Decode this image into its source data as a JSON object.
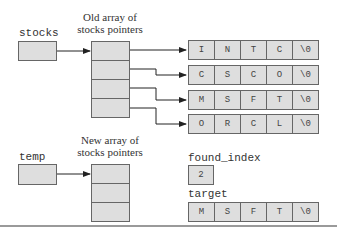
{
  "labels": {
    "stocks": "stocks",
    "temp": "temp",
    "old_array_caption_line1": "Old array of",
    "old_array_caption_line2": "stocks pointers",
    "new_array_caption_line1": "New array of",
    "new_array_caption_line2": "stocks pointers",
    "found_index": "found_index",
    "target": "target"
  },
  "old_array": {
    "cells": 4
  },
  "new_array": {
    "cells": 3
  },
  "strings": [
    [
      "I",
      "N",
      "T",
      "C",
      "\\0"
    ],
    [
      "C",
      "S",
      "C",
      "O",
      "\\0"
    ],
    [
      "M",
      "S",
      "F",
      "T",
      "\\0"
    ],
    [
      "O",
      "R",
      "C",
      "L",
      "\\0"
    ]
  ],
  "found_index_value": "2",
  "target_chars": [
    "M",
    "S",
    "F",
    "T",
    "\\0"
  ],
  "colors": {
    "cell_fill": "#dedede",
    "stroke": "#666666",
    "arrow": "#222222"
  }
}
